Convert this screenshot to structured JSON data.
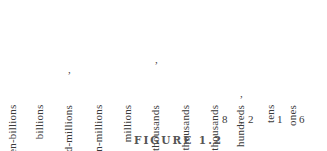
{
  "place_values": [
    {
      "label": "ten-billions",
      "x": 18
    },
    {
      "label": "billions",
      "x": 45
    },
    {
      "label": "hundred-millions",
      "x": 74,
      "comma_before": true
    },
    {
      "label": "ten-millions",
      "x": 104
    },
    {
      "label": "millions",
      "x": 133
    },
    {
      "label": "hundred-thousands",
      "x": 161,
      "comma_before": true
    },
    {
      "label": "ten-thousands",
      "x": 191
    },
    {
      "label": "thousands",
      "x": 220
    },
    {
      "label": "hundreds",
      "x": 246,
      "comma_before": true
    },
    {
      "label": "tens",
      "x": 276
    },
    {
      "label": "ones",
      "x": 298
    }
  ],
  "digits": [
    {
      "value": "8",
      "x": 224
    },
    {
      "value": ",",
      "x": 240
    },
    {
      "value": "2",
      "x": 250
    },
    {
      "value": "1",
      "x": 279
    },
    {
      "value": "6",
      "x": 301
    }
  ],
  "caption": "FIGURE 1.2"
}
